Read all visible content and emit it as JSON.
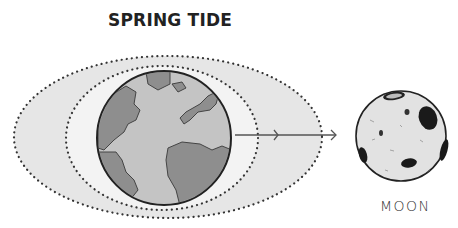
{
  "title": "SPRING TIDE",
  "labels": {
    "moon": "MOON"
  },
  "elements": {
    "outer_bulge": {
      "type": "dotted-ellipse",
      "fill": "#e6e6e6"
    },
    "inner_bulge": {
      "type": "dotted-ellipse",
      "fill": "#f2f2f2"
    },
    "earth": {
      "ocean": "#c8c8c8",
      "land": "#8c8c8c"
    },
    "arrow": {
      "direction": "earth-to-moon"
    },
    "moon": {
      "fill": "#e2e2e2"
    }
  },
  "colors": {
    "dots": "#333333",
    "outline": "#222222"
  }
}
